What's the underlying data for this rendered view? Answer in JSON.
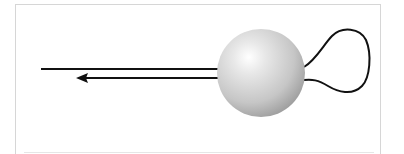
{
  "diagram": {
    "colors": {
      "frame": "#d6d6d6",
      "stroke": "#111111",
      "sphere_highlight": "#ffffff",
      "sphere_mid": "#d4d4d4",
      "sphere_shadow": "#9a9a9a"
    },
    "elements": {
      "sphere": {
        "cx": 261,
        "cy": 73,
        "r": 44
      },
      "upper_line": {
        "x1": 41,
        "y1": 69,
        "x2": 218,
        "y2": 69
      },
      "lower_arrow_line": {
        "x1": 218,
        "y1": 78,
        "x2": 76,
        "y2": 78,
        "arrowhead": "left"
      },
      "loop": {
        "attach_top": [
          304,
          67
        ],
        "attach_bottom": [
          304,
          80
        ],
        "extent_right": 368,
        "extent_top": 31,
        "extent_bottom": 92
      }
    }
  }
}
